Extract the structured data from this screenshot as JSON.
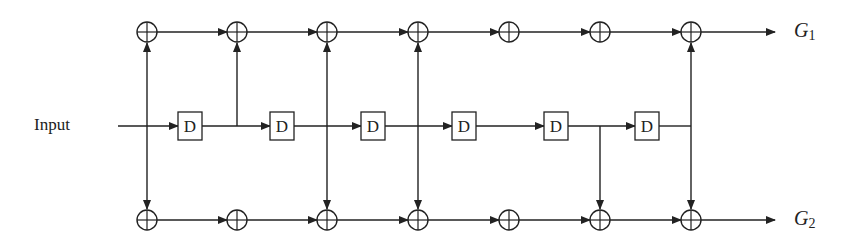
{
  "diagram": {
    "input_label": "Input",
    "delay_label": "D",
    "outputs": [
      {
        "name": "G",
        "sub": "1"
      },
      {
        "name": "G",
        "sub": "2"
      }
    ],
    "xor_x": [
      147,
      237,
      327,
      418,
      509,
      600,
      691
    ],
    "delay_x": [
      190,
      282,
      373,
      464,
      556,
      647
    ],
    "taps_top": [
      0,
      1,
      2,
      3,
      6
    ],
    "taps_bottom": [
      0,
      2,
      3,
      5,
      6
    ],
    "color": "#222222"
  }
}
